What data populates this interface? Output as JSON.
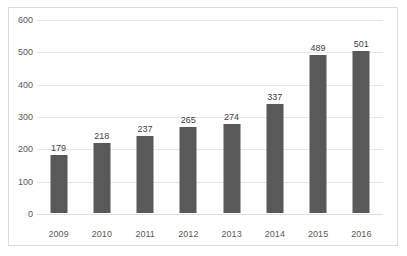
{
  "chart_data": {
    "type": "bar",
    "title": "",
    "xlabel": "",
    "ylabel": "",
    "categories": [
      "2009",
      "2010",
      "2011",
      "2012",
      "2013",
      "2014",
      "2015",
      "2016"
    ],
    "values": [
      179,
      218,
      237,
      265,
      274,
      337,
      489,
      501
    ],
    "data_labels": [
      "179",
      "218",
      "237",
      "265",
      "274",
      "337",
      "489",
      "501"
    ],
    "ylim": [
      0,
      600
    ],
    "ytick_labels": [
      "0",
      "100",
      "200",
      "300",
      "400",
      "500",
      "600"
    ],
    "ytick_values": [
      0,
      100,
      200,
      300,
      400,
      500,
      600
    ],
    "grid": true,
    "legend": "none",
    "series_color": "#595959",
    "gridline_color": "#e6e6e6",
    "frame_color": "#dcdcdc",
    "label_color": "#58595b"
  }
}
